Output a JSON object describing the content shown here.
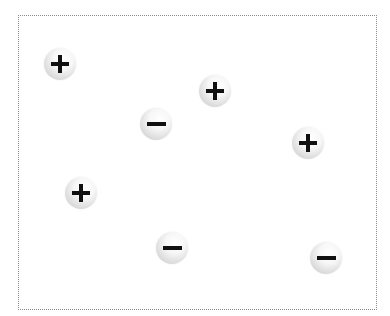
{
  "diagram": {
    "title": "",
    "frame": {
      "border_style": "dotted",
      "border_color": "#8a8a8a",
      "background": "#ffffff"
    },
    "charges": [
      {
        "sign": "+",
        "type": "positive",
        "x": 60,
        "y": 64
      },
      {
        "sign": "+",
        "type": "positive",
        "x": 215,
        "y": 91
      },
      {
        "sign": "−",
        "type": "negative",
        "x": 156,
        "y": 124
      },
      {
        "sign": "+",
        "type": "positive",
        "x": 308,
        "y": 143
      },
      {
        "sign": "+",
        "type": "positive",
        "x": 81,
        "y": 193
      },
      {
        "sign": "−",
        "type": "negative",
        "x": 172,
        "y": 248
      },
      {
        "sign": "−",
        "type": "negative",
        "x": 326,
        "y": 258
      }
    ],
    "counts": {
      "positive": 4,
      "negative": 3
    },
    "colors": {
      "sphere_highlight": "#ffffff",
      "sphere_shade": "#c4c4c4",
      "sign": "#111111"
    }
  }
}
